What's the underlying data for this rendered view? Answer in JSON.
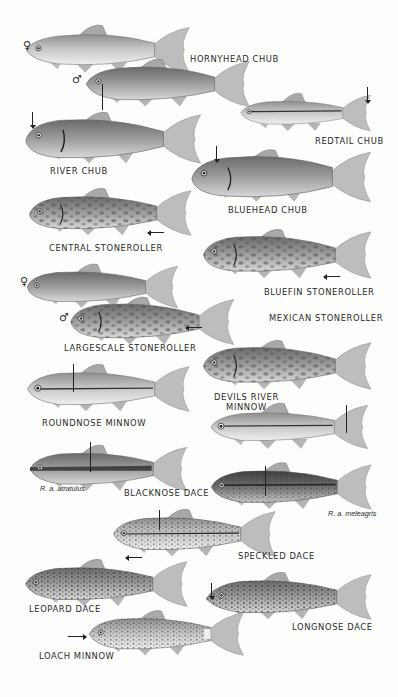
{
  "plate": {
    "species": [
      {
        "id": "hornyhead-chub",
        "label": "HORNYHEAD CHUB",
        "variants": [
          "female",
          "male"
        ]
      },
      {
        "id": "redtail-chub",
        "label": "REDTAIL CHUB"
      },
      {
        "id": "river-chub",
        "label": "RIVER CHUB"
      },
      {
        "id": "bluehead-chub",
        "label": "BLUEHEAD CHUB"
      },
      {
        "id": "central-stoneroller",
        "label": "CENTRAL STONEROLLER"
      },
      {
        "id": "bluefin-stoneroller",
        "label": "BLUEFIN STONEROLLER"
      },
      {
        "id": "largescale-stoneroller",
        "label": "LARGESCALE STONEROLLER",
        "variants": [
          "female",
          "male"
        ]
      },
      {
        "id": "mexican-stoneroller",
        "label": "MEXICAN STONEROLLER"
      },
      {
        "id": "roundnose-minnow",
        "label": "ROUNDNOSE MINNOW"
      },
      {
        "id": "devils-river-minnow",
        "label_line1": "DEVILS RIVER",
        "label_line2": "MINNOW"
      },
      {
        "id": "blacknose-dace",
        "label": "BLACKNOSE DACE",
        "subspecies": [
          "R. a. atratulus",
          "R. a. meleagris"
        ]
      },
      {
        "id": "speckled-dace",
        "label": "SPECKLED DACE"
      },
      {
        "id": "leopard-dace",
        "label": "LEOPARD DACE"
      },
      {
        "id": "longnose-dace",
        "label": "LONGNOSE DACE"
      },
      {
        "id": "loach-minnow",
        "label": "LOACH MINNOW"
      }
    ],
    "symbols": {
      "female": "♀",
      "male": "♂"
    },
    "colors": {
      "background": "#fdfdfc",
      "fish_light": "#cfcfcf",
      "fish_mid": "#9a9a9a",
      "fish_dark": "#5c5c5c",
      "ink": "#222222"
    }
  }
}
